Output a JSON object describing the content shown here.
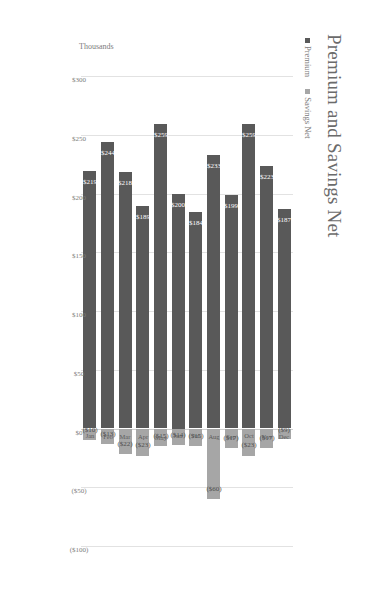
{
  "chart_data": {
    "type": "bar",
    "title": "Premium and Savings Net",
    "subtitle": "",
    "orientation": "vertical-clustered-rotated",
    "xlabel": "",
    "ylabel": "Thousands",
    "ylim": [
      -100,
      300
    ],
    "grid": true,
    "legend_position": "top-left",
    "units": "Thousands",
    "categories": [
      "Jan",
      "Feb",
      "Mar",
      "Apr",
      "May",
      "Jun",
      "Jul",
      "Aug",
      "Sep",
      "Oct",
      "Nov",
      "Dec"
    ],
    "series": [
      {
        "name": "Premium",
        "color": "#595959",
        "values": [
          219,
          244,
          218,
          189,
          259,
          200,
          184,
          233,
          199,
          259,
          223,
          187
        ],
        "labels": [
          "$219",
          "$244",
          "$218",
          "$189",
          "$259",
          "$200",
          "$184",
          "$233",
          "$199",
          "$259",
          "$223",
          "$187"
        ]
      },
      {
        "name": "Savings Net",
        "color": "#a6a6a6",
        "values": [
          -10,
          -13,
          -22,
          -23,
          -15,
          -14,
          -15,
          -60,
          -17,
          -23,
          -17,
          -9
        ],
        "labels": [
          "($10)",
          "($13)",
          "($22)",
          "($23)",
          "($15)",
          "($14)",
          "($15)",
          "($60)",
          "($17)",
          "($23)",
          "($17)",
          "($9)"
        ]
      }
    ],
    "tick_labels": [
      "$300",
      "$250",
      "$200",
      "$150",
      "$100",
      "$50",
      "$0",
      "($50)",
      "($100)"
    ],
    "tick_values": [
      300,
      250,
      200,
      150,
      100,
      50,
      0,
      -50,
      -100
    ]
  },
  "legend": {
    "items": [
      {
        "label": "Premium",
        "color": "#595959"
      },
      {
        "label": "Savings Net",
        "color": "#a6a6a6"
      }
    ]
  },
  "axis": {
    "title": "Thousands"
  }
}
